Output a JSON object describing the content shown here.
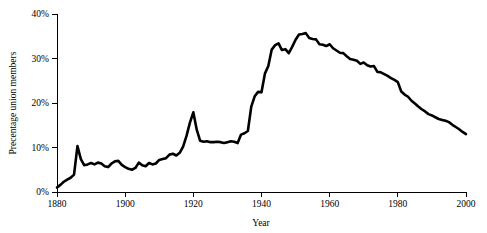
{
  "chart_data": {
    "type": "line",
    "title": "",
    "xlabel": "Year",
    "ylabel": "Precentage union members",
    "xlim": [
      1880,
      2000
    ],
    "ylim": [
      0,
      40
    ],
    "grid": false,
    "legend": null,
    "x_ticks": [
      1880,
      1900,
      1920,
      1940,
      1960,
      1980,
      2000
    ],
    "x_tick_labels": [
      "1880",
      "1900",
      "1920",
      "1940",
      "1960",
      "1980",
      "2000"
    ],
    "y_ticks": [
      0,
      10,
      20,
      30,
      40
    ],
    "y_tick_labels": [
      "0%",
      "10%",
      "20%",
      "30%",
      "40%"
    ],
    "series": [
      {
        "name": "Percentage union members",
        "color": "#000000",
        "x": [
          1880,
          1881,
          1882,
          1883,
          1884,
          1885,
          1886,
          1887,
          1888,
          1889,
          1890,
          1891,
          1892,
          1893,
          1894,
          1895,
          1896,
          1897,
          1898,
          1899,
          1900,
          1901,
          1902,
          1903,
          1904,
          1905,
          1906,
          1907,
          1908,
          1909,
          1910,
          1911,
          1912,
          1913,
          1914,
          1915,
          1916,
          1917,
          1918,
          1919,
          1920,
          1921,
          1922,
          1923,
          1924,
          1925,
          1926,
          1927,
          1928,
          1929,
          1930,
          1931,
          1932,
          1933,
          1934,
          1935,
          1936,
          1937,
          1938,
          1939,
          1940,
          1941,
          1942,
          1943,
          1944,
          1945,
          1946,
          1947,
          1948,
          1949,
          1950,
          1951,
          1952,
          1953,
          1954,
          1955,
          1956,
          1957,
          1958,
          1959,
          1960,
          1961,
          1962,
          1963,
          1964,
          1965,
          1966,
          1967,
          1968,
          1969,
          1970,
          1971,
          1972,
          1973,
          1974,
          1975,
          1976,
          1977,
          1978,
          1979,
          1980,
          1981,
          1982,
          1983,
          1984,
          1985,
          1986,
          1987,
          1988,
          1989,
          1990,
          1991,
          1992,
          1993,
          1994,
          1995,
          1996,
          1997,
          1998,
          1999,
          2000
        ],
        "y": [
          1.0,
          1.6,
          2.3,
          2.8,
          3.2,
          3.9,
          10.3,
          7.4,
          6.0,
          6.2,
          6.5,
          6.2,
          6.6,
          6.4,
          5.8,
          5.6,
          6.4,
          6.9,
          7.0,
          6.1,
          5.6,
          5.2,
          5.0,
          5.4,
          6.6,
          6.0,
          5.8,
          6.5,
          6.2,
          6.4,
          7.2,
          7.4,
          7.6,
          8.4,
          8.6,
          8.2,
          8.8,
          10.2,
          12.6,
          15.6,
          17.9,
          14.0,
          11.5,
          11.3,
          11.4,
          11.2,
          11.2,
          11.3,
          11.2,
          11.0,
          11.2,
          11.4,
          11.3,
          11.0,
          12.9,
          13.2,
          13.7,
          19.2,
          21.5,
          22.5,
          22.4,
          26.6,
          28.3,
          32.0,
          33.0,
          33.4,
          31.9,
          32.1,
          31.2,
          32.6,
          34.2,
          35.4,
          35.5,
          35.7,
          34.6,
          34.4,
          34.3,
          33.2,
          33.1,
          32.8,
          33.2,
          32.3,
          31.8,
          31.3,
          31.2,
          30.5,
          29.9,
          29.7,
          29.5,
          28.8,
          29.1,
          28.5,
          28.2,
          28.3,
          27.0,
          26.9,
          26.5,
          26.1,
          25.6,
          25.2,
          24.7,
          22.6,
          21.9,
          21.4,
          20.5,
          19.9,
          19.2,
          18.6,
          18.1,
          17.5,
          17.2,
          16.8,
          16.4,
          16.2,
          16.0,
          15.7,
          15.1,
          14.6,
          14.1,
          13.5,
          13.0
        ]
      }
    ]
  },
  "layout": {
    "plot_left": 57,
    "plot_right": 466,
    "plot_top": 14,
    "plot_bottom": 192
  }
}
